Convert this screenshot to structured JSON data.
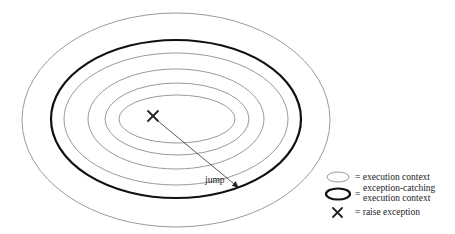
{
  "diagram": {
    "center": {
      "x": 176,
      "y": 120
    },
    "contexts": [
      {
        "rx": 154,
        "ry": 107,
        "kind": "execution context"
      },
      {
        "rx": 125,
        "ry": 79,
        "kind": "exception-catching execution context"
      },
      {
        "rx": 112,
        "ry": 68,
        "kind": "execution context"
      },
      {
        "rx": 88,
        "ry": 51,
        "kind": "execution context"
      },
      {
        "rx": 72,
        "ry": 36,
        "kind": "execution context"
      },
      {
        "rx": 58,
        "ry": 24,
        "kind": "execution context"
      }
    ],
    "raise_point": {
      "x": 153,
      "y": 116
    },
    "jump": {
      "label": "jump",
      "to": {
        "x": 239,
        "y": 188
      }
    }
  },
  "legend": {
    "items": [
      {
        "symbol": "thin-ellipse",
        "text": "= execution context"
      },
      {
        "symbol": "thick-ellipse",
        "eq": "=",
        "lines": [
          "exception-catching",
          "execution context"
        ]
      },
      {
        "symbol": "x-mark",
        "text": "= raise exception"
      }
    ]
  },
  "colors": {
    "thin": "#9a9a9a",
    "thick": "#111111",
    "arrow": "#444444"
  }
}
